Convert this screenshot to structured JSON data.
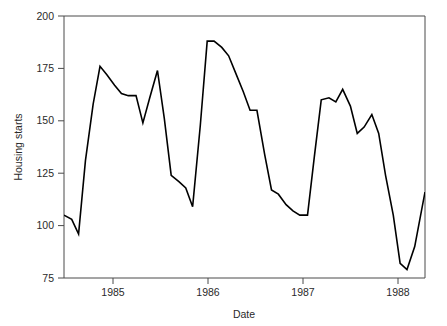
{
  "chart_data": {
    "type": "line",
    "title": "",
    "xlabel": "Date",
    "ylabel": "Housing starts",
    "ylim": [
      75,
      200
    ],
    "yticks": [
      75,
      100,
      125,
      150,
      175,
      200
    ],
    "ytick_labels": [
      "75",
      "100",
      "125",
      "150",
      "175",
      "200"
    ],
    "xlim": [
      1984.58,
      1988.79
    ],
    "xticks": [
      1985,
      1986,
      1987,
      1988
    ],
    "xtick_labels": [
      "1985",
      "1986",
      "1987",
      "1988"
    ],
    "grid": false,
    "legend": null,
    "line_color": "#000000",
    "series": [
      {
        "name": "Housing starts",
        "x": [
          1984.58,
          1984.67,
          1984.75,
          1984.83,
          1984.92,
          1985.0,
          1985.08,
          1985.17,
          1985.25,
          1985.33,
          1985.42,
          1985.5,
          1985.58,
          1985.67,
          1985.75,
          1985.83,
          1985.92,
          1986.0,
          1986.08,
          1986.17,
          1986.25,
          1986.33,
          1986.42,
          1986.5,
          1986.58,
          1986.67,
          1986.75,
          1986.83,
          1986.92,
          1987.0,
          1987.08,
          1987.17,
          1987.25,
          1987.33,
          1987.42,
          1987.5,
          1987.58,
          1987.67,
          1987.75,
          1987.83,
          1987.92,
          1988.0,
          1988.08,
          1988.17,
          1988.25,
          1988.33,
          1988.42,
          1988.5,
          1988.58,
          1988.67,
          1988.79
        ],
        "values": [
          105,
          103,
          96,
          131,
          158,
          176,
          172,
          167,
          163,
          162,
          162,
          149,
          161,
          174,
          151,
          124,
          121,
          118,
          109,
          148,
          188,
          188,
          185,
          181,
          173,
          164,
          155,
          155,
          134,
          117,
          115,
          110,
          107,
          105,
          105,
          133,
          160,
          161,
          159,
          165,
          157,
          144,
          147,
          153,
          144,
          124,
          105,
          82,
          79,
          90,
          116
        ]
      }
    ],
    "annotations": []
  },
  "chart_render": {
    "plot_left": 64,
    "plot_right": 425,
    "plot_top": 16,
    "plot_bottom": 278,
    "polyline_points": "64.6,252.4 71.6,256.6 78.5,271.2 85.4,197.9 92.3,141.3 99.2,103.6 106.1,112.0 113.0,122.4 119.9,130.8 126.8,132.9 133.7,132.9 140.6,160.1 147.5,134.9 154.4,107.8 161.3,155.9 168.2,212.5 175.1,218.8 182.0,225.0 188.9,243.8 195.8,162.2 202.7,78.6 209.6,78.6 216.5,84.9 223.4,93.2 230.3,109.9 237.2,128.7 244.1,147.6 251.0,147.6 257.9,191.6 264.8,227.1 271.7,231.3 278.6,241.7 285.5,248.0 292.4,252.2 299.3,252.2 306.2,193.7 313.1,137.1 320.0,135.0 326.9,139.2 333.8,126.6 340.7,143.4 347.6,170.6 354.5,164.3 361.4,151.7 368.3,170.6 375.2,212.5 382.1,252.2 389.0,300.4 395.9,306.7 402.8,283.7 412.0,229.2",
    "note_clip": "polyline y-values are clamped to plot box at render time"
  },
  "figure": {
    "background_color": "#ffffff",
    "axis_color": "#4a4a4a",
    "text_color": "#2a2a2a"
  }
}
